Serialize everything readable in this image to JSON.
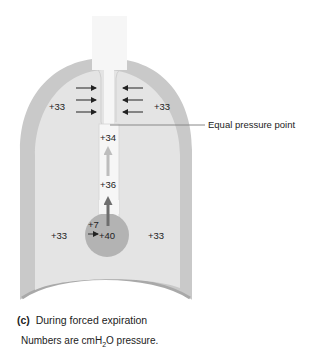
{
  "diagram": {
    "pleural_pressure_labels": {
      "upper_left": "+33",
      "upper_right": "+33",
      "lower_left": "+33",
      "lower_right": "+33"
    },
    "airway_pressure_labels": {
      "upper_airway": "+34",
      "mid_airway": "+36",
      "alveolus": "+40",
      "elastic_recoil": "+7"
    },
    "callout": "Equal pressure point",
    "colors": {
      "chest_wall": "#c9c9c9",
      "pleural_space": "#e4e4e4",
      "airway": "#f6f6f6",
      "alveolus": "#b3b3b3",
      "airflow_arrow": "#6e6e6e",
      "compression_arrow": "#222222"
    }
  },
  "caption": {
    "panel_letter": "(c)",
    "panel_title": "During forced expiration",
    "note_prefix": "Numbers are cmH",
    "note_subscript": "2",
    "note_suffix": "O pressure."
  }
}
